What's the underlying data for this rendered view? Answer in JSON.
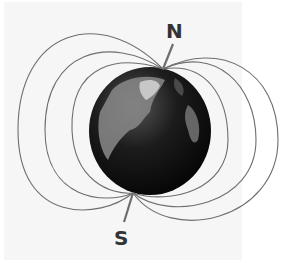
{
  "diagram": {
    "labels": {
      "north": "N",
      "south": "S"
    },
    "colors": {
      "field_line": "#6e6e6e",
      "label": "#333333",
      "globe_dark": "#111111",
      "globe_land": "#8a8a8a",
      "panel": "#f6f6f6"
    },
    "field_lines_per_side": 3
  }
}
